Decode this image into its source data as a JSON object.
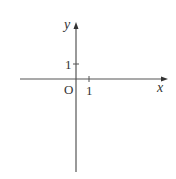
{
  "diagram": {
    "type": "coordinate-plane",
    "axes": {
      "x_label": "x",
      "y_label": "y",
      "origin_label": "O",
      "x_tick_label": "1",
      "y_tick_label": "1"
    },
    "colors": {
      "axis": "#555555",
      "text": "#333333",
      "background": "#ffffff"
    }
  }
}
